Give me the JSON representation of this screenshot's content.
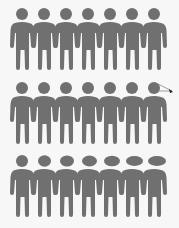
{
  "colors": {
    "figure": "#707070",
    "background": "#f7f7f7",
    "pointer": "#222222"
  },
  "rows": [
    {
      "name": "row-1",
      "top": 6,
      "figures": [
        {
          "head_rx": 6,
          "head_ry": 6,
          "head_dx": 0
        },
        {
          "head_rx": 6,
          "head_ry": 6,
          "head_dx": 0
        },
        {
          "head_rx": 6,
          "head_ry": 6,
          "head_dx": 0
        },
        {
          "head_rx": 6,
          "head_ry": 6,
          "head_dx": 0
        },
        {
          "head_rx": 6,
          "head_ry": 6,
          "head_dx": 0
        },
        {
          "head_rx": 6,
          "head_ry": 6,
          "head_dx": 0
        },
        {
          "head_rx": 6,
          "head_ry": 6,
          "head_dx": 0
        }
      ]
    },
    {
      "name": "row-2",
      "top": 80,
      "figures": [
        {
          "head_rx": 6,
          "head_ry": 6,
          "head_dx": 0
        },
        {
          "head_rx": 6,
          "head_ry": 6,
          "head_dx": 0
        },
        {
          "head_rx": 6,
          "head_ry": 6,
          "head_dx": 0
        },
        {
          "head_rx": 6,
          "head_ry": 6,
          "head_dx": 0
        },
        {
          "head_rx": 6,
          "head_ry": 6,
          "head_dx": 0
        },
        {
          "head_rx": 6,
          "head_ry": 6,
          "head_dx": 0
        },
        {
          "head_rx": 6,
          "head_ry": 6,
          "head_dx": 0
        }
      ],
      "pointer": {
        "from_x": 158,
        "from_y": 86,
        "to_x": 172,
        "to_y": 91
      }
    },
    {
      "name": "row-3",
      "top": 153,
      "figures": [
        {
          "head_rx": 6,
          "head_ry": 6,
          "head_dx": 0
        },
        {
          "head_rx": 6.5,
          "head_ry": 5.8,
          "head_dx": 0.5
        },
        {
          "head_rx": 7,
          "head_ry": 5.6,
          "head_dx": 1
        },
        {
          "head_rx": 7.5,
          "head_ry": 5.4,
          "head_dx": 1.5
        },
        {
          "head_rx": 8,
          "head_ry": 5.2,
          "head_dx": 2
        },
        {
          "head_rx": 8.5,
          "head_ry": 5,
          "head_dx": 2.5
        },
        {
          "head_rx": 9,
          "head_ry": 5,
          "head_dx": 3
        }
      ]
    }
  ],
  "layout": {
    "first_x": 9,
    "spacing": 22
  }
}
